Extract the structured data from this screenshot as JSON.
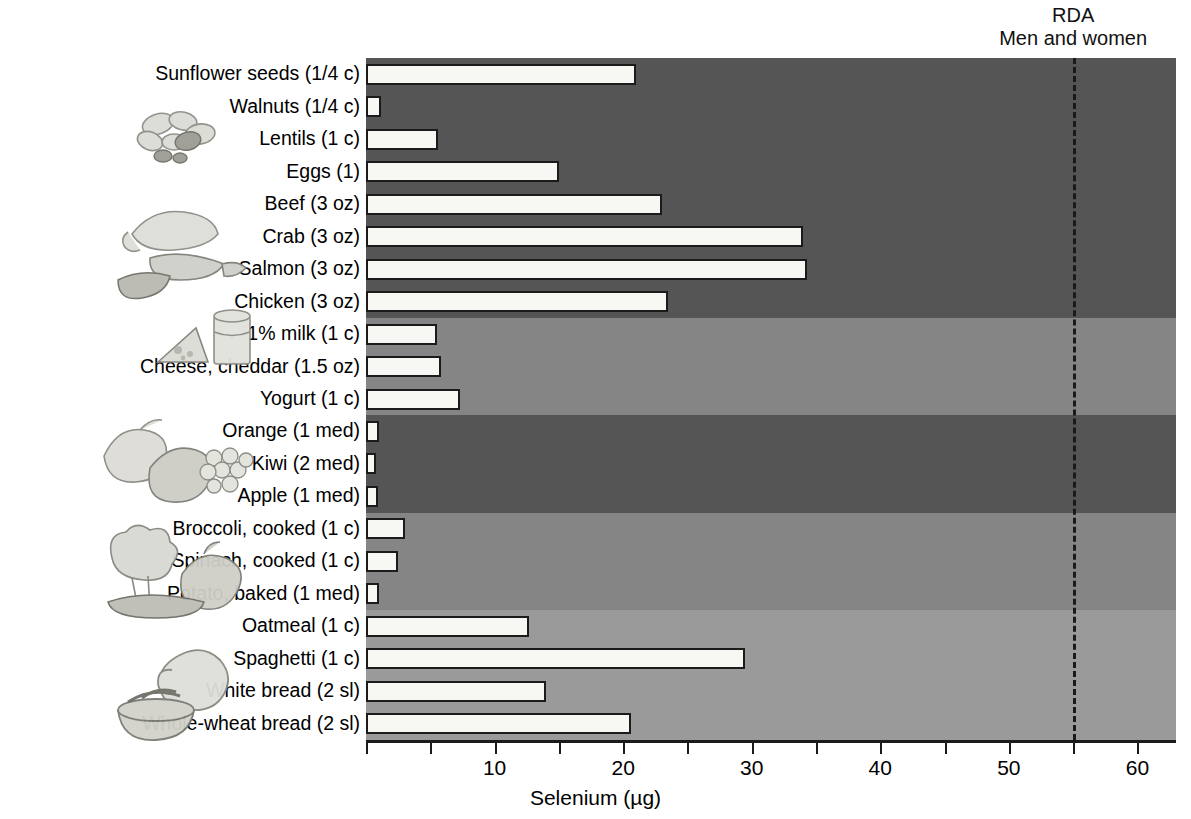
{
  "annotation": {
    "rda_line1": "RDA",
    "rda_line2": "Men and women",
    "rda_value": 55
  },
  "axis": {
    "title": "Selenium (µg)",
    "ticks": [
      0,
      5,
      10,
      15,
      20,
      25,
      30,
      35,
      40,
      45,
      50,
      55,
      60
    ],
    "tick_labels": [
      "10",
      "20",
      "30",
      "40",
      "50",
      "60"
    ],
    "tick_label_values": [
      10,
      20,
      30,
      40,
      50,
      60
    ],
    "min": 0,
    "max": 63
  },
  "caption": {
    "figure_label": "Figure 13.15",
    "text": "Selenium content of NuVal-certified foods"
  },
  "groups": [
    {
      "name": "protein-foods",
      "shade": "#555555",
      "count": 8
    },
    {
      "name": "dairy",
      "shade": "#858585",
      "count": 3
    },
    {
      "name": "fruits",
      "shade": "#555555",
      "count": 3
    },
    {
      "name": "vegetables",
      "shade": "#858585",
      "count": 3
    },
    {
      "name": "grains",
      "shade": "#9a9a9a",
      "count": 4
    }
  ],
  "chart_data": {
    "type": "bar",
    "orientation": "horizontal",
    "title": "",
    "xlabel": "Selenium (µg)",
    "ylabel": "",
    "xlim": [
      0,
      63
    ],
    "grid": false,
    "legend": "none",
    "categories": [
      "Sunflower seeds (1/4 c)",
      "Walnuts (1/4 c)",
      "Lentils (1 c)",
      "Eggs (1)",
      "Beef (3 oz)",
      "Crab (3 oz)",
      "Salmon (3 oz)",
      "Chicken (3 oz)",
      "1% milk (1 c)",
      "Cheese, cheddar (1.5 oz)",
      "Yogurt (1 c)",
      "Orange (1 med)",
      "Kiwi (2 med)",
      "Apple (1 med)",
      "Broccoli, cooked (1 c)",
      "Spinach, cooked (1 c)",
      "Potato, baked (1 med)",
      "Oatmeal (1 c)",
      "Spaghetti (1 c)",
      "White bread (2 sl)",
      "Whole-wheat bread (2 sl)"
    ],
    "values": [
      21,
      1.2,
      5.6,
      15,
      23,
      34,
      34.3,
      23.5,
      5.5,
      5.8,
      7.3,
      1,
      0.8,
      0.9,
      3,
      2.5,
      1,
      12.7,
      29.5,
      14,
      20.6
    ],
    "annotations": [
      {
        "label": "RDA Men and women",
        "x": 55,
        "style": "dashed-vertical-line"
      }
    ]
  }
}
